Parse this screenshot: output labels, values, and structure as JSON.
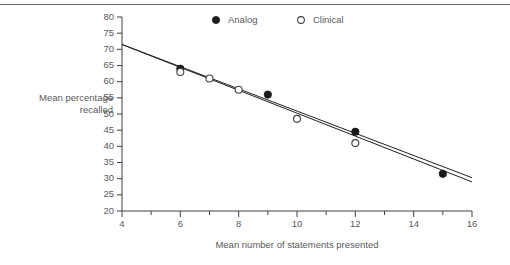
{
  "chart_data": {
    "type": "scatter",
    "title": "",
    "xlabel": "Mean number of statements presented",
    "ylabel": "Mean percentage recalled",
    "xlim": [
      4,
      16
    ],
    "ylim": [
      20,
      80
    ],
    "xticks": [
      4,
      5,
      6,
      7,
      8,
      9,
      10,
      11,
      12,
      13,
      14,
      15,
      16
    ],
    "xtick_labels": [
      "4",
      "",
      "6",
      "",
      "8",
      "",
      "10",
      "",
      "12",
      "",
      "14",
      "",
      "16"
    ],
    "yticks": [
      20,
      25,
      30,
      35,
      40,
      45,
      50,
      55,
      60,
      65,
      70,
      75,
      80
    ],
    "ytick_labels": [
      "20",
      "25",
      "30",
      "35",
      "40",
      "45",
      "50",
      "55",
      "60",
      "65",
      "70",
      "75",
      "80"
    ],
    "grid": false,
    "legend_position": "top-center",
    "series": [
      {
        "name": "Analog",
        "marker": "filled-circle",
        "color": "#1a1a1a",
        "points": [
          {
            "x": 6,
            "y": 64.0
          },
          {
            "x": 9,
            "y": 56.0
          },
          {
            "x": 12,
            "y": 44.5
          },
          {
            "x": 15,
            "y": 31.5
          }
        ],
        "fit_line": {
          "x1": 4,
          "y1": 71.5,
          "x2": 16,
          "y2": 29.0
        }
      },
      {
        "name": "Clinical",
        "marker": "open-circle",
        "color": "#414042",
        "points": [
          {
            "x": 6,
            "y": 63.0
          },
          {
            "x": 7,
            "y": 61.0
          },
          {
            "x": 8,
            "y": 57.5
          },
          {
            "x": 10,
            "y": 48.5
          },
          {
            "x": 12,
            "y": 41.0
          }
        ],
        "fit_line": {
          "x1": 4,
          "y1": 71.5,
          "x2": 16,
          "y2": 30.3
        }
      }
    ]
  },
  "axis_titles": {
    "y_line1": "Mean percentage",
    "y_line2": "recalled",
    "x": "Mean number of statements presented"
  },
  "legend": {
    "items": [
      {
        "label": "Analog",
        "marker": "filled-circle"
      },
      {
        "label": "Clinical",
        "marker": "open-circle"
      }
    ]
  },
  "colors": {
    "axis": "#414042",
    "text": "#58595b",
    "line": "#231f20",
    "rule": "#6d6e71",
    "background": "#ffffff"
  }
}
